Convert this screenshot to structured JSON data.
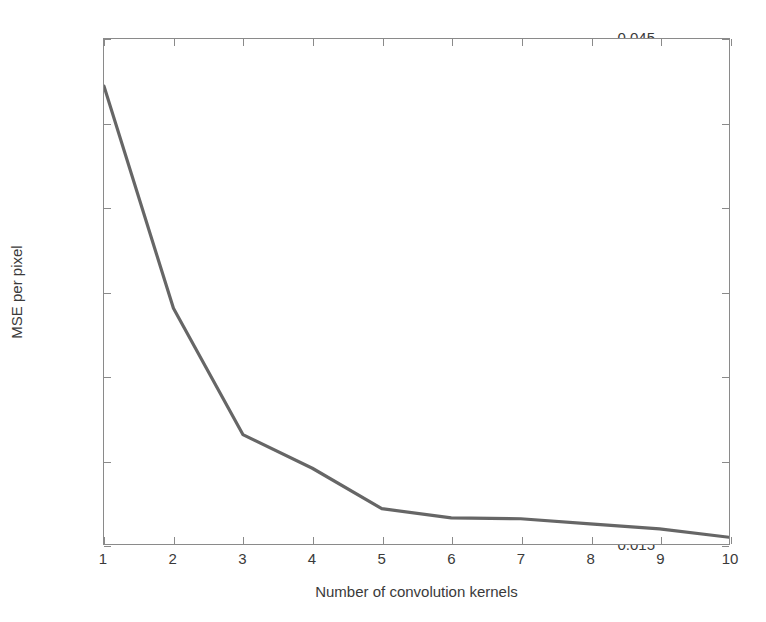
{
  "chart_data": {
    "type": "line",
    "title": "",
    "xlabel": "Number of convolution kernels",
    "ylabel": "MSE per pixel",
    "x": [
      1,
      2,
      3,
      4,
      5,
      6,
      7,
      8,
      9,
      10
    ],
    "values": [
      0.0422,
      0.029,
      0.0215,
      0.0195,
      0.0171,
      0.01655,
      0.0165,
      0.0162,
      0.0159,
      0.0154
    ],
    "series": [
      {
        "name": "MSE per pixel",
        "values": [
          0.0422,
          0.029,
          0.0215,
          0.0195,
          0.0171,
          0.01655,
          0.0165,
          0.0162,
          0.0159,
          0.0154
        ],
        "color": "#666666"
      }
    ],
    "xlim": [
      1,
      10
    ],
    "ylim": [
      0.015,
      0.045
    ],
    "xticks": [
      1,
      2,
      3,
      4,
      5,
      6,
      7,
      8,
      9,
      10
    ],
    "xtick_labels": [
      "1",
      "2",
      "3",
      "4",
      "5",
      "6",
      "7",
      "8",
      "9",
      "10"
    ],
    "yticks": [
      0.015,
      0.02,
      0.025,
      0.03,
      0.035,
      0.04,
      0.045
    ],
    "ytick_labels": [
      "0.015",
      "0.02",
      "0.025",
      "0.03",
      "0.035",
      "0.04",
      "0.045"
    ],
    "grid": false,
    "legend": null,
    "legend_position": "none",
    "line_color": "#666666",
    "axis_color": "#8a8a8a",
    "background_color": "#ffffff"
  }
}
